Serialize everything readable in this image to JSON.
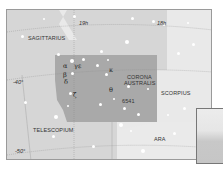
{
  "map": {
    "constellations": {
      "sagittarius": "SAGITTARIUS",
      "corona_line1": "CORONA",
      "corona_line2": "AUSTRALIS",
      "scorpius": "SCORPIUS",
      "telescopium": "TELESCOPIUM",
      "ara": "ARA"
    },
    "ra_labels": {
      "ra19": "19h",
      "ra18": "18h"
    },
    "dec_labels": {
      "dec40": "-40°",
      "dec50": "-50°"
    },
    "object_label": "6541",
    "greek": {
      "alpha": "α",
      "gamma": "γ",
      "epsilon": "ε",
      "beta": "β",
      "delta": "δ",
      "zeta": "ζ",
      "kappa": "κ",
      "theta": "θ"
    },
    "colors": {
      "background": "#d6d6d6",
      "highlight_region": "#a9a9a9",
      "light_region": "#ebebeb",
      "border": "#9a9a9a"
    }
  }
}
